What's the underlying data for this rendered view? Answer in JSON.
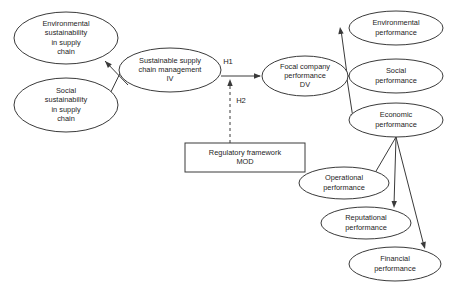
{
  "diagram": {
    "type": "conceptual-model",
    "background_color": "#ffffff",
    "line_color": "#3a3a3a",
    "text_color": "#1d1d1d",
    "nodes": [
      {
        "id": "environmental-sustainability",
        "shape": "ellipse",
        "lines": [
          "Environmental",
          "sustainability",
          "in supply",
          "chain"
        ],
        "cx": 66,
        "cy": 38,
        "rx": 52,
        "ry": 26
      },
      {
        "id": "social-sustainability",
        "shape": "ellipse",
        "lines": [
          "Social",
          "sustainability",
          "in supply",
          "chain"
        ],
        "cx": 66,
        "cy": 105,
        "rx": 52,
        "ry": 27
      },
      {
        "id": "sustainable-supply-chain-management",
        "shape": "ellipse",
        "lines": [
          "Sustainable supply",
          "chain management",
          "IV"
        ],
        "cx": 170,
        "cy": 70,
        "rx": 51,
        "ry": 22
      },
      {
        "id": "focal-company-performance",
        "shape": "ellipse",
        "lines": [
          "Focal company",
          "performance",
          "DV"
        ],
        "cx": 305,
        "cy": 76,
        "rx": 43,
        "ry": 20
      },
      {
        "id": "regulatory-framework",
        "shape": "rect",
        "lines": [
          "Regulatory framework",
          "MOD"
        ],
        "x": 185,
        "y": 143,
        "width": 120,
        "height": 29
      },
      {
        "id": "environmental-performance",
        "shape": "ellipse",
        "lines": [
          "Environmental",
          "performance"
        ],
        "cx": 396,
        "cy": 28,
        "rx": 47,
        "ry": 17
      },
      {
        "id": "social-performance",
        "shape": "ellipse",
        "lines": [
          "Social",
          "performance"
        ],
        "cx": 396,
        "cy": 76,
        "rx": 47,
        "ry": 17
      },
      {
        "id": "economic-performance",
        "shape": "ellipse",
        "lines": [
          "Economic",
          "performance"
        ],
        "cx": 396,
        "cy": 120,
        "rx": 47,
        "ry": 17
      },
      {
        "id": "operational-performance",
        "shape": "ellipse",
        "lines": [
          "Operational",
          "performance"
        ],
        "cx": 344,
        "cy": 183,
        "rx": 45,
        "ry": 16
      },
      {
        "id": "reputational-performance",
        "shape": "ellipse",
        "lines": [
          "Reputational",
          "performance"
        ],
        "cx": 366,
        "cy": 223,
        "rx": 45,
        "ry": 16
      },
      {
        "id": "financial-performance",
        "shape": "ellipse",
        "lines": [
          "Financial",
          "performance"
        ],
        "cx": 395,
        "cy": 264,
        "rx": 46,
        "ry": 17
      }
    ],
    "edges": [
      {
        "id": "sscm-to-environmental-sustainability",
        "from": "sustainable-supply-chain-management",
        "to": "environmental-sustainability",
        "style": "solid",
        "path": "M 128 85 L 105 61",
        "arrow_at": {
          "x": 105,
          "y": 61,
          "angle": 226
        }
      },
      {
        "id": "sscm-to-social-sustainability",
        "from": "sustainable-supply-chain-management",
        "to": "social-sustainability",
        "style": "solid",
        "path": "M 128 57 L 105 104",
        "arrow_at": {
          "x": 105,
          "y": 104,
          "angle": 116
        }
      },
      {
        "id": "sscm-to-focal-company",
        "from": "sustainable-supply-chain-management",
        "to": "focal-company-performance",
        "style": "solid",
        "label": "H1",
        "label_x": 228,
        "label_y": 62,
        "path": "M 221 76 L 260 76",
        "arrow_at": {
          "x": 261,
          "y": 76,
          "angle": 0
        }
      },
      {
        "id": "regulatory-framework-to-h1-path",
        "from": "regulatory-framework",
        "to": "sscm-to-focal-company",
        "style": "dashed",
        "label": "H2",
        "label_x": 241,
        "label_y": 101,
        "path": "M 230 143 L 230 82",
        "arrow_at": {
          "x": 230,
          "y": 79,
          "angle": 270
        }
      },
      {
        "id": "focal-to-environmental-performance",
        "from": "focal-company-performance",
        "to": "environmental-performance",
        "style": "solid",
        "path": "M 347 74 L 341 30",
        "arrow_at": {
          "x": 340,
          "y": 27,
          "angle": 262
        }
      },
      {
        "id": "focal-to-social-performance",
        "from": "focal-company-performance",
        "to": "social-performance",
        "style": "solid",
        "path": "M 347 76 L 347 76",
        "arrow_at": {
          "x": 350,
          "y": 76,
          "angle": 0
        }
      },
      {
        "id": "focal-to-economic-performance",
        "from": "focal-company-performance",
        "to": "economic-performance",
        "style": "solid",
        "path": "M 347 79 L 353 118",
        "arrow_at": {
          "x": 354,
          "y": 121,
          "angle": 81
        }
      },
      {
        "id": "economic-to-operational-performance",
        "from": "economic-performance",
        "to": "operational-performance",
        "style": "solid",
        "path": "M 396 137 L 372 178",
        "arrow_at": {
          "x": 371,
          "y": 180,
          "angle": 120
        }
      },
      {
        "id": "economic-to-reputational-performance",
        "from": "economic-performance",
        "to": "reputational-performance",
        "style": "solid",
        "path": "M 396 137 L 394 205",
        "arrow_at": {
          "x": 394,
          "y": 208,
          "angle": 92
        }
      },
      {
        "id": "economic-to-financial-performance",
        "from": "economic-performance",
        "to": "financial-performance",
        "style": "solid",
        "path": "M 396 137 L 424 246",
        "arrow_at": {
          "x": 425,
          "y": 249,
          "angle": 75
        }
      }
    ]
  }
}
